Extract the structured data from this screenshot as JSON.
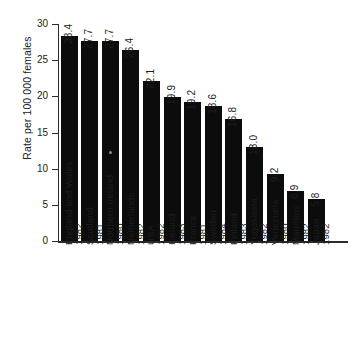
{
  "chart_data": {
    "type": "bar",
    "title": "",
    "xlabel": "",
    "ylabel": "Rate per 100 000 females",
    "ylim": [
      0,
      30
    ],
    "yticks": [
      0,
      5,
      10,
      15,
      20,
      25,
      30
    ],
    "ytick_labels": [
      "0",
      "5",
      "10",
      "15",
      "20",
      "25",
      "30"
    ],
    "grid": false,
    "legend": "none",
    "bar_color": "#0c0c0c",
    "axis_color": "#2b2b2b",
    "categories": [
      "England and Wales",
      "Scotland",
      "Northern Ireland",
      "Netherlands",
      "USA",
      "Iceland",
      "France",
      "Sweden",
      "Finland",
      "Yugoslavia",
      "Venezuela",
      "Mauritius",
      "Japan"
    ],
    "years": [
      "1982",
      "1981",
      "1980",
      "1982",
      "1982",
      "1983",
      "1981",
      "1984",
      "1983",
      "1982",
      "1980",
      "1982",
      "1982"
    ],
    "values": [
      28.4,
      27.7,
      27.7,
      26.4,
      22.1,
      19.9,
      19.2,
      18.6,
      16.8,
      13.0,
      9.2,
      6.9,
      5.8
    ],
    "value_labels": [
      "28.4",
      "27.7",
      "27.7",
      "26.4",
      "22.1",
      "19.9",
      "19.2",
      "18.6",
      "16.8",
      "13.0",
      "9.2",
      "6.9",
      "5.8"
    ],
    "bars": [
      {
        "category": "England and Wales",
        "year": "1982",
        "value": 28.4,
        "label": "28.4"
      },
      {
        "category": "Scotland",
        "year": "1981",
        "value": 27.7,
        "label": "27.7"
      },
      {
        "category": "Northern Ireland",
        "year": "1980",
        "value": 27.7,
        "label": "27.7"
      },
      {
        "category": "Netherlands",
        "year": "1982",
        "value": 26.4,
        "label": "26.4"
      },
      {
        "category": "USA",
        "year": "1982",
        "value": 22.1,
        "label": "22.1"
      },
      {
        "category": "Iceland",
        "year": "1983",
        "value": 19.9,
        "label": "19.9"
      },
      {
        "category": "France",
        "year": "1981",
        "value": 19.2,
        "label": "19.2"
      },
      {
        "category": "Sweden",
        "year": "1984",
        "value": 18.6,
        "label": "18.6"
      },
      {
        "category": "Finland",
        "year": "1983",
        "value": 16.8,
        "label": "16.8"
      },
      {
        "category": "Yugoslavia",
        "year": "1982",
        "value": 13.0,
        "label": "13.0"
      },
      {
        "category": "Venezuela",
        "year": "1980",
        "value": 9.2,
        "label": "9.2"
      },
      {
        "category": "Mauritius",
        "year": "1982",
        "value": 6.9,
        "label": "6.9"
      },
      {
        "category": "Japan",
        "year": "1982",
        "value": 5.8,
        "label": "5.8"
      }
    ]
  }
}
